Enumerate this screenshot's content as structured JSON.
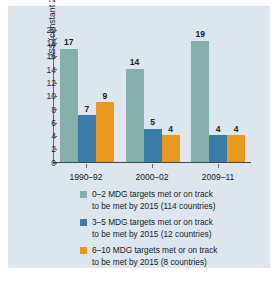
{
  "chart_data": {
    "type": "bar",
    "title": "",
    "xlabel": "",
    "ylabel": "US$ (constant 2010)",
    "ylim": [
      0,
      20
    ],
    "yticks": [
      20,
      18,
      16,
      14,
      12,
      10,
      8,
      6,
      4,
      2,
      0
    ],
    "grid": false,
    "legend_position": "bottom",
    "categories": [
      "1990–92",
      "2000–02",
      "2009–11"
    ],
    "series": [
      {
        "name": "0–2 MDG targets met or on track to be met by 2015 (114 countries)",
        "color": "#84b0a9",
        "values": [
          17,
          14,
          19
        ]
      },
      {
        "name": "3–5 MDG targets met or on track to be met by 2015 (12 countries)",
        "color": "#3a7ca5",
        "values": [
          7,
          5,
          4
        ]
      },
      {
        "name": "6–10 MDG targets met or on track to be met by 2015 (8 countries)",
        "color": "#e8981e",
        "values": [
          9,
          4,
          4
        ]
      }
    ],
    "legend": [
      {
        "color": "#84b0a9",
        "line1": "0–2 MDG targets met or on track",
        "line2": "to be met by 2015 (114 countries)"
      },
      {
        "color": "#3a7ca5",
        "line1": "3–5 MDG targets met or on track",
        "line2": "to be met by 2015 (12 countries)"
      },
      {
        "color": "#e8981e",
        "line1": "6–10 MDG targets met or on track",
        "line2": "to be met by 2015 (8 countries)"
      }
    ]
  }
}
